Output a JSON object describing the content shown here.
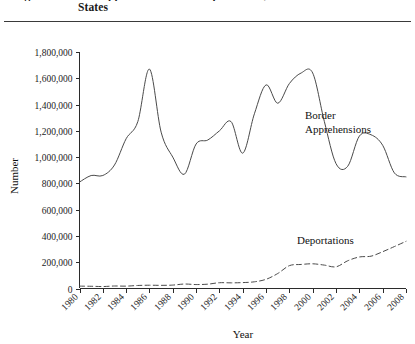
{
  "figure": {
    "title_line_1": "Figure 1.  Border Apprehensions and Deportations, United",
    "title_line_2": "States"
  },
  "chart_data": {
    "type": "line",
    "title": "",
    "xlabel": "Year",
    "ylabel": "Number",
    "xlim": [
      1980,
      2008
    ],
    "ylim": [
      0,
      1800000
    ],
    "grid": false,
    "legend": "inline-annotations",
    "x_tick_labels": [
      "1980",
      "1982",
      "1984",
      "1986",
      "1988",
      "1990",
      "1992",
      "1994",
      "1996",
      "1998",
      "2000",
      "2002",
      "2004",
      "2006",
      "2008"
    ],
    "y_tick_labels": [
      "0",
      "200,000",
      "400,000",
      "600,000",
      "800,000",
      "1,000,000",
      "1,200,000",
      "1,400,000",
      "1,600,000",
      "1,800,000"
    ],
    "y_ticks": [
      0,
      200000,
      400000,
      600000,
      800000,
      1000000,
      1200000,
      1400000,
      1600000,
      1800000
    ],
    "x": [
      1980,
      1981,
      1982,
      1983,
      1984,
      1985,
      1986,
      1987,
      1988,
      1989,
      1990,
      1991,
      1992,
      1993,
      1994,
      1995,
      1996,
      1997,
      1998,
      1999,
      2000,
      2001,
      2002,
      2003,
      2004,
      2005,
      2006,
      2007,
      2008
    ],
    "series": [
      {
        "name": "Border Apprehensions",
        "style": "solid",
        "color": "#4a4a4a",
        "annotation": "Border\nApprehensions",
        "annotation_line_1": "Border",
        "annotation_line_2": "Apprehensions",
        "values": [
          810000,
          860000,
          860000,
          940000,
          1140000,
          1270000,
          1670000,
          1190000,
          1000000,
          870000,
          1100000,
          1130000,
          1200000,
          1270000,
          1030000,
          1330000,
          1550000,
          1410000,
          1560000,
          1640000,
          1640000,
          1270000,
          950000,
          930000,
          1160000,
          1170000,
          1090000,
          880000,
          850000
        ]
      },
      {
        "name": "Deportations",
        "style": "dashed",
        "color": "#4a4a4a",
        "annotation": "Deportations",
        "values": [
          18000,
          17000,
          15000,
          19000,
          18000,
          23000,
          25000,
          24000,
          26000,
          34000,
          30000,
          33000,
          44000,
          43000,
          45000,
          51000,
          70000,
          114000,
          174000,
          183000,
          188000,
          178000,
          165000,
          211000,
          240000,
          246000,
          280000,
          319000,
          359000
        ]
      }
    ]
  }
}
